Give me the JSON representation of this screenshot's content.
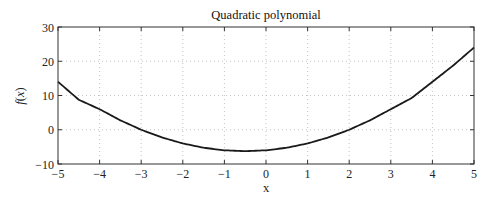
{
  "chart_data": {
    "type": "line",
    "title": "Quadratic polynomial",
    "xlabel": "x",
    "ylabel": "f(x)",
    "xlim": [
      -5,
      5
    ],
    "ylim": [
      -10,
      30
    ],
    "xticks": [
      -5,
      -4,
      -3,
      -2,
      -1,
      0,
      1,
      2,
      3,
      4,
      5
    ],
    "yticks": [
      -10,
      0,
      10,
      20,
      30
    ],
    "grid": true,
    "legend": null,
    "series": [
      {
        "name": "f(x) = x^2 + x - 6",
        "color": "#1a1a1a",
        "x": [
          -5,
          -4.5,
          -4,
          -3.5,
          -3,
          -2.5,
          -2,
          -1.5,
          -1,
          -0.5,
          0,
          0.5,
          1,
          1.5,
          2,
          2.5,
          3,
          3.5,
          4,
          4.5,
          5
        ],
        "y": [
          14,
          8.75,
          6,
          2.75,
          0,
          -2.25,
          -4,
          -5.25,
          -6,
          -6.25,
          -6,
          -5.25,
          -4,
          -2.25,
          0,
          2.75,
          6,
          9.25,
          14,
          18.75,
          24
        ]
      }
    ]
  },
  "labels": {
    "title": "Quadratic polynomial",
    "xlabel": "x",
    "ylabel_f": "f",
    "ylabel_paren_open": "(",
    "ylabel_x": "x",
    "ylabel_paren_close": ")",
    "xticks": [
      "−5",
      "−4",
      "−3",
      "−2",
      "−1",
      "0",
      "1",
      "2",
      "3",
      "4",
      "5"
    ],
    "yticks": [
      "30",
      "20",
      "10",
      "0",
      "−10"
    ]
  }
}
